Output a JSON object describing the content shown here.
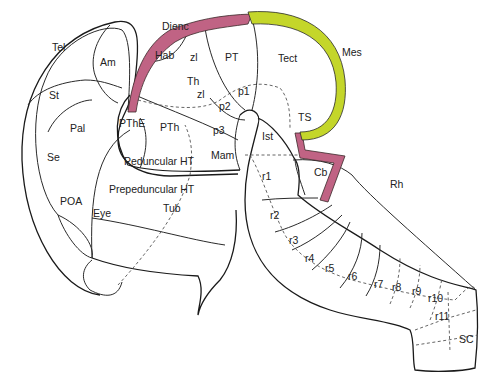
{
  "diagram": {
    "colors": {
      "outline": "#1a1a1a",
      "dashed": "#555555",
      "diencephalic_band": "#c06384",
      "mesencephalic_band": "#c4d62a"
    },
    "labels": {
      "tel": "Tel",
      "am": "Am",
      "st": "St",
      "pal": "Pal",
      "se": "Se",
      "poa": "POA",
      "eye": "Eye",
      "dienc": "Dienc",
      "hab": "Hab",
      "zl1": "zl",
      "zl2": "zl",
      "th": "Th",
      "pt": "PT",
      "p1": "p1",
      "p2": "p2",
      "p3": "p3",
      "pthe": "PThE",
      "pth": "PTh",
      "mam": "Mam",
      "peduncular_ht": "Peduncular HT",
      "prepeduncular_ht": "Prepeduncular HT",
      "tub": "Tub",
      "tect": "Tect",
      "mes": "Mes",
      "ts": "TS",
      "ist": "Ist",
      "cb": "Cb",
      "rh": "Rh",
      "r1": "r1",
      "r2": "r2",
      "r3": "r3",
      "r4": "r4",
      "r5": "r5",
      "r6": "r6",
      "r7": "r7",
      "r8": "r8",
      "r9": "r9",
      "r10": "r10",
      "r11": "r11",
      "sc": "SC"
    }
  }
}
